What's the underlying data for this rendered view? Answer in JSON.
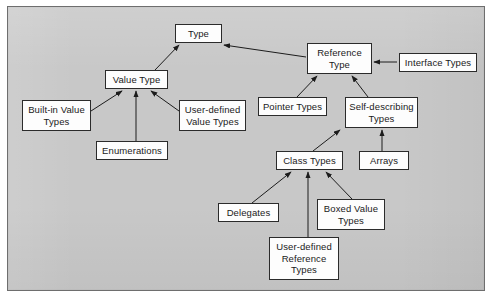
{
  "diagram": {
    "style": {
      "page_background": "#ffffff",
      "canvas_background": "#c8c8c8",
      "frame_border_color": "#6e6e6e",
      "node_fill": "#fdfdfd",
      "node_border_color": "#2b2b2b",
      "edge_color": "#1c1c1c",
      "text_color": "#1a1a1a"
    },
    "nodes": [
      {
        "id": "type",
        "label": "Type",
        "x": 175,
        "y": 24,
        "w": 47,
        "h": 19
      },
      {
        "id": "value_type",
        "label": "Value Type",
        "x": 105,
        "y": 70,
        "w": 63,
        "h": 19
      },
      {
        "id": "reference_type",
        "label": "Reference\nType",
        "x": 307,
        "y": 43,
        "w": 65,
        "h": 31
      },
      {
        "id": "interface_types",
        "label": "Interface Types",
        "x": 399,
        "y": 53,
        "w": 78,
        "h": 19
      },
      {
        "id": "builtin_value",
        "label": "Built-in Value\nTypes",
        "x": 22,
        "y": 100,
        "w": 69,
        "h": 31
      },
      {
        "id": "enumerations",
        "label": "Enumerations",
        "x": 96,
        "y": 141,
        "w": 72,
        "h": 19
      },
      {
        "id": "userdef_value",
        "label": "User-defined\nValue Types",
        "x": 179,
        "y": 100,
        "w": 67,
        "h": 31
      },
      {
        "id": "pointer_types",
        "label": "Pointer Types",
        "x": 258,
        "y": 97,
        "w": 69,
        "h": 19
      },
      {
        "id": "self_describing",
        "label": "Self-describing\nTypes",
        "x": 345,
        "y": 97,
        "w": 73,
        "h": 31
      },
      {
        "id": "class_types",
        "label": "Class Types",
        "x": 276,
        "y": 151,
        "w": 67,
        "h": 19
      },
      {
        "id": "arrays",
        "label": "Arrays",
        "x": 359,
        "y": 151,
        "w": 50,
        "h": 19
      },
      {
        "id": "delegates",
        "label": "Delegates",
        "x": 218,
        "y": 203,
        "w": 61,
        "h": 19
      },
      {
        "id": "boxed_value",
        "label": "Boxed Value\nTypes",
        "x": 317,
        "y": 199,
        "w": 68,
        "h": 31
      },
      {
        "id": "userdef_ref",
        "label": "User-defined\nReference\nTypes",
        "x": 269,
        "y": 237,
        "w": 70,
        "h": 43
      }
    ],
    "edges": [
      {
        "id": "value_type-to-type",
        "from": "value_type",
        "to": "type",
        "from_point": [
          155,
          70
        ],
        "to_point": [
          179,
          45
        ]
      },
      {
        "id": "reference_type-to-type",
        "from": "reference_type",
        "to": "type",
        "from_point": [
          306,
          57
        ],
        "to_point": [
          224,
          45
        ]
      },
      {
        "id": "interface_types-to-reference",
        "from": "interface_types",
        "to": "reference_type",
        "from_point": [
          397,
          62
        ],
        "to_point": [
          374,
          62
        ]
      },
      {
        "id": "builtin_value-to-value_type",
        "from": "builtin_value",
        "to": "value_type",
        "from_point": [
          91,
          111
        ],
        "to_point": [
          122,
          91
        ]
      },
      {
        "id": "enumerations-to-value_type",
        "from": "enumerations",
        "to": "value_type",
        "from_point": [
          136,
          141
        ],
        "to_point": [
          136,
          91
        ]
      },
      {
        "id": "userdef_value-to-value_type",
        "from": "userdef_value",
        "to": "value_type",
        "from_point": [
          179,
          111
        ],
        "to_point": [
          151,
          91
        ]
      },
      {
        "id": "pointer_types-to-reference",
        "from": "pointer_types",
        "to": "reference_type",
        "from_point": [
          297,
          97
        ],
        "to_point": [
          317,
          76
        ]
      },
      {
        "id": "selfdesc-to-reference",
        "from": "self_describing",
        "to": "reference_type",
        "from_point": [
          368,
          97
        ],
        "to_point": [
          352,
          76
        ]
      },
      {
        "id": "class_types-to-selfdesc",
        "from": "class_types",
        "to": "self_describing",
        "from_point": [
          313,
          151
        ],
        "to_point": [
          340,
          130
        ]
      },
      {
        "id": "arrays-to-selfdesc",
        "from": "arrays",
        "to": "self_describing",
        "from_point": [
          382,
          151
        ],
        "to_point": [
          382,
          130
        ]
      },
      {
        "id": "delegates-to-class_types",
        "from": "delegates",
        "to": "class_types",
        "from_point": [
          252,
          203
        ],
        "to_point": [
          291,
          172
        ]
      },
      {
        "id": "userdef_ref-to-class_types",
        "from": "userdef_ref",
        "to": "class_types",
        "from_point": [
          308,
          237
        ],
        "to_point": [
          308,
          172
        ]
      },
      {
        "id": "boxed_value-to-class_types",
        "from": "boxed_value",
        "to": "class_types",
        "from_point": [
          352,
          199
        ],
        "to_point": [
          326,
          172
        ]
      }
    ]
  }
}
